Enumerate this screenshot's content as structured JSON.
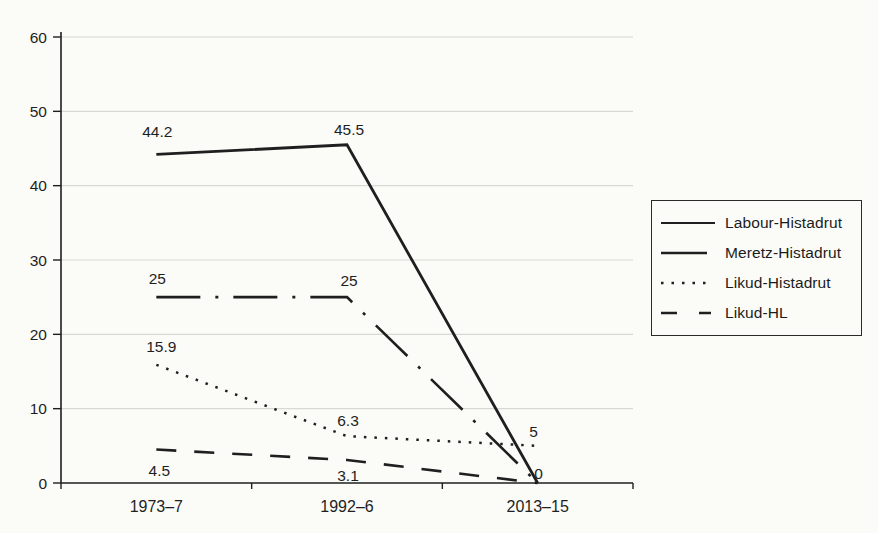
{
  "chart_data": {
    "type": "line",
    "title": "",
    "categories": [
      "1973–7",
      "1992–6",
      "2013–15"
    ],
    "series": [
      {
        "name": "Labour-Histadrut",
        "style": "solid",
        "values": [
          44.2,
          45.5,
          0
        ],
        "point_labels": [
          {
            "text": "44.2",
            "dx": 1,
            "dy": -17
          },
          {
            "text": "45.5",
            "dx": 2,
            "dy": -10
          },
          null
        ]
      },
      {
        "name": "Meretz-Histadrut",
        "style": "dashdot",
        "values": [
          25,
          25,
          0
        ],
        "point_labels": [
          {
            "text": "25",
            "dx": 1,
            "dy": -13
          },
          {
            "text": "25",
            "dx": 2,
            "dy": -11
          },
          null
        ]
      },
      {
        "name": "Likud-Histadrut",
        "style": "dotted",
        "values": [
          15.9,
          6.3,
          5
        ],
        "point_labels": [
          {
            "text": "15.9",
            "dx": 5,
            "dy": -13
          },
          {
            "text": "6.3",
            "dx": 1,
            "dy": -10
          },
          {
            "text": "5",
            "dx": -4,
            "dy": -9
          }
        ]
      },
      {
        "name": "Likud-HL",
        "style": "dashed",
        "values": [
          4.5,
          3.1,
          0
        ],
        "point_labels": [
          {
            "text": "4.5",
            "dx": 3,
            "dy": 26
          },
          {
            "text": "3.1",
            "dx": 1,
            "dy": 21
          },
          {
            "text": "0",
            "dx": 1,
            "dy": -4
          }
        ]
      }
    ],
    "ylim": [
      0,
      60
    ],
    "yticks": [
      0,
      10,
      20,
      30,
      40,
      50,
      60
    ],
    "grid": "horizontal",
    "legend_position": "right",
    "ink_color": "#1f1f1f",
    "grid_color": "#d9d8d3"
  }
}
